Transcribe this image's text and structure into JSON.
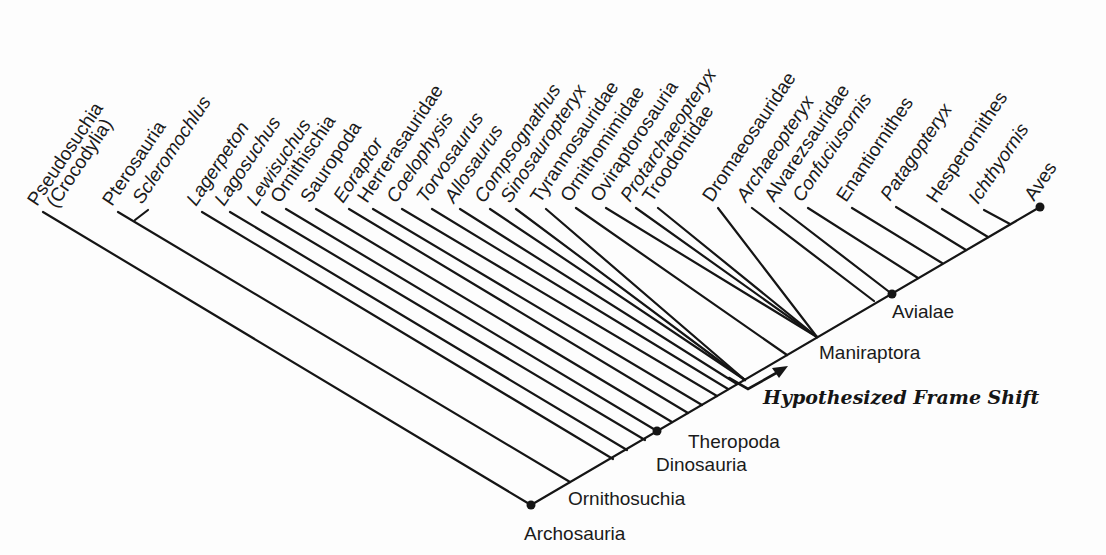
{
  "diagram": {
    "type": "cladogram",
    "line_color": "#151515",
    "taxa": [
      {
        "name": "Pseudosuchia",
        "sub": "(Crocodylia)",
        "italic": false,
        "tip": [
          43,
          212
        ],
        "join": [
          531,
          505
        ]
      },
      {
        "name": "Pterosauria",
        "italic": false,
        "tip": [
          118,
          212
        ],
        "join": [
          570,
          482
        ]
      },
      {
        "name": "Scleromochlus",
        "italic": true,
        "tip": [
          148,
          210
        ],
        "join": [
          135,
          220
        ]
      },
      {
        "name": "Lagerpeton",
        "italic": true,
        "tip": [
          202,
          212
        ],
        "join": [
          613,
          459
        ]
      },
      {
        "name": "Lagosuchus",
        "italic": true,
        "tip": [
          230,
          212
        ],
        "join": [
          627,
          450
        ]
      },
      {
        "name": "Lewisuchus",
        "italic": true,
        "tip": [
          262,
          212
        ],
        "join": [
          645,
          440
        ]
      },
      {
        "name": "Ornithischia",
        "italic": false,
        "tip": [
          286,
          209
        ],
        "join": [
          657,
          431
        ]
      },
      {
        "name": "Sauropoda",
        "italic": false,
        "tip": [
          316,
          209
        ],
        "join": [
          672,
          422
        ]
      },
      {
        "name": "Eoraptor",
        "italic": true,
        "tip": [
          349,
          209
        ],
        "join": [
          688,
          413
        ]
      },
      {
        "name": "Herrerasauridae",
        "italic": false,
        "tip": [
          373,
          209
        ],
        "join": [
          702,
          405
        ]
      },
      {
        "name": "Coelophysis",
        "italic": true,
        "tip": [
          402,
          209
        ],
        "join": [
          717,
          396
        ]
      },
      {
        "name": "Torvosaurus",
        "italic": true,
        "tip": [
          432,
          209
        ],
        "join": [
          728,
          389
        ]
      },
      {
        "name": "Allosaurus",
        "italic": true,
        "tip": [
          460,
          209
        ],
        "join": [
          737,
          384
        ]
      },
      {
        "name": "Compsognathus",
        "italic": true,
        "tip": [
          490,
          209
        ],
        "join": [
          745,
          380
        ]
      },
      {
        "name": "Sinosauropteryx",
        "italic": true,
        "tip": [
          516,
          209
        ],
        "join": [
          745,
          380
        ]
      },
      {
        "name": "Tyrannosauridae",
        "italic": false,
        "tip": [
          546,
          209
        ],
        "join": [
          745,
          380
        ]
      },
      {
        "name": "Ornithomimidae",
        "italic": false,
        "tip": [
          576,
          208
        ],
        "join": [
          787,
          355
        ]
      },
      {
        "name": "Oviraptorosauria",
        "italic": false,
        "tip": [
          606,
          208
        ],
        "join": [
          817,
          337
        ]
      },
      {
        "name": "Protarchaeopteryx",
        "italic": true,
        "tip": [
          636,
          208
        ],
        "join": [
          817,
          337
        ]
      },
      {
        "name": "Troodontidae",
        "italic": false,
        "tip": [
          658,
          208
        ],
        "join": [
          817,
          337
        ]
      },
      {
        "name": "Dromaeosauridae",
        "italic": false,
        "tip": [
          718,
          208
        ],
        "join": [
          817,
          337
        ]
      },
      {
        "name": "Archaeopteryx",
        "italic": true,
        "tip": [
          752,
          208
        ],
        "join": [
          874,
          301
        ]
      },
      {
        "name": "Alvarezsauridae",
        "italic": false,
        "tip": [
          780,
          208
        ],
        "join": [
          892,
          294
        ]
      },
      {
        "name": "Confuciusornis",
        "italic": true,
        "tip": [
          808,
          208
        ],
        "join": [
          918,
          278
        ]
      },
      {
        "name": "Enantiornithes",
        "italic": false,
        "tip": [
          852,
          208
        ],
        "join": [
          942,
          263
        ]
      },
      {
        "name": "Patagopteryx",
        "italic": true,
        "tip": [
          896,
          207
        ],
        "join": [
          966,
          250
        ]
      },
      {
        "name": "Hesperornithes",
        "italic": false,
        "tip": [
          942,
          209
        ],
        "join": [
          988,
          237
        ]
      },
      {
        "name": "Ichthyornis",
        "italic": true,
        "tip": [
          984,
          210
        ],
        "join": [
          1010,
          224
        ]
      },
      {
        "name": "Aves",
        "italic": false,
        "tip": [
          1040,
          207
        ],
        "join": [
          1040,
          207
        ]
      }
    ],
    "spine": {
      "from": [
        531,
        505
      ],
      "to": [
        1040,
        207
      ]
    },
    "nodes": [
      {
        "name": "Archosauria",
        "dot": [
          531,
          505
        ],
        "label_pos": [
          524,
          535
        ]
      },
      {
        "name": "Ornithosuchia",
        "dot": null,
        "label_pos": [
          567,
          503
        ]
      },
      {
        "name": "Dinosauria",
        "dot": [
          657,
          431
        ],
        "label_pos": [
          656,
          470
        ]
      },
      {
        "name": "Theropoda",
        "dot": null,
        "label_pos": [
          690,
          447
        ]
      },
      {
        "name": "Maniraptora",
        "dot": null,
        "label_pos": [
          820,
          358
        ]
      },
      {
        "name": "Avialae",
        "dot": [
          892,
          294
        ],
        "label_pos": [
          892,
          318
        ]
      },
      {
        "name": "Aves",
        "dot": [
          1040,
          207
        ],
        "label_pos": null
      }
    ],
    "annotation": {
      "text": "Hypothesized Frame Shift",
      "arrow": {
        "start": [
          729,
          378
        ],
        "corner": [
          748,
          389
        ],
        "end": [
          786,
          367
        ]
      },
      "label_pos": [
        763,
        403
      ]
    }
  },
  "labels": {
    "archosauria": "Archosauria",
    "ornithosuchia": "Ornithosuchia",
    "dinosauria": "Dinosauria",
    "theropoda": "Theropoda",
    "maniraptora": "Maniraptora",
    "avialae": "Avialae",
    "frame_shift": "Hypothesized Frame Shift"
  }
}
